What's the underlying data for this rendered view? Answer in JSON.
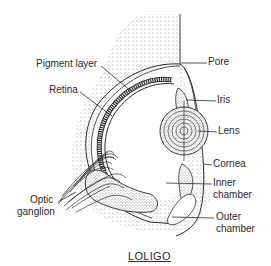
{
  "diagram": {
    "title": "LOLIGO",
    "labels": {
      "pigment_layer": "Pigment layer",
      "retina": "Retina",
      "optic_ganglion_line1": "Optic",
      "optic_ganglion_line2": "ganglion",
      "pore": "Pore",
      "iris": "Iris",
      "lens": "Lens",
      "cornea": "Cornea",
      "inner_chamber_line1": "Inner",
      "inner_chamber_line2": "chamber",
      "outer_chamber_line1": "Outer",
      "outer_chamber_line2": "chamber"
    },
    "colors": {
      "ink": "#2a2a2a",
      "stipple": "#9a9a9a",
      "background": "#ffffff"
    }
  }
}
